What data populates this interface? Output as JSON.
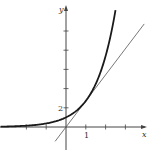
{
  "chart_data": {
    "type": "line",
    "title": "",
    "xlabel": "x",
    "ylabel": "y",
    "x_tick_labels": [
      {
        "value": 1,
        "label": "1"
      }
    ],
    "y_tick_labels": [
      {
        "value": 2,
        "label": "2"
      }
    ],
    "x_ticks": [
      -2,
      -1,
      1,
      2,
      3
    ],
    "y_ticks": [
      2,
      4,
      6,
      8,
      10
    ],
    "xlim": [
      -3.3,
      4.1
    ],
    "ylim": [
      -2.2,
      13
    ],
    "grid": false,
    "legend": null,
    "series": [
      {
        "name": "y = e^x",
        "style": "thick curve",
        "function": "exp(x)",
        "x_range": [
          -3.3,
          2.5
        ]
      },
      {
        "name": "tangent y = e·x at (1, e)",
        "style": "thin line",
        "function": "e*x",
        "x_range": [
          -0.55,
          3.95
        ]
      }
    ],
    "colors": {
      "curve": "#1a1a1a",
      "tangent": "#555555",
      "axes": "#444444"
    }
  },
  "labels": {
    "x_axis": "x",
    "y_axis": "y",
    "tick_1": "1",
    "tick_2": "2"
  }
}
